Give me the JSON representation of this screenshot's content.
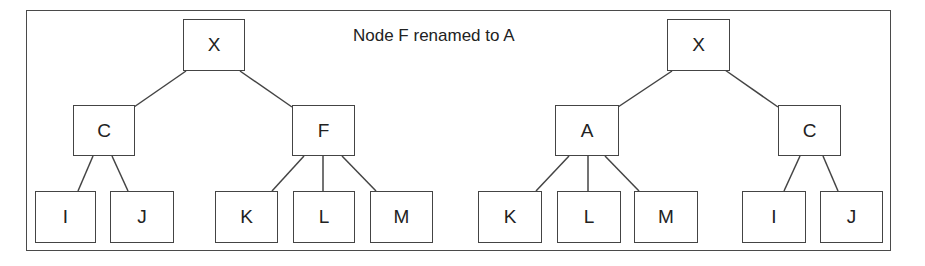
{
  "caption": "Node F renamed to A",
  "frame": {
    "x": 26,
    "y": 10,
    "w": 865,
    "h": 241
  },
  "colors": {
    "line": "#444444",
    "text": "#222222",
    "background": "#ffffff"
  },
  "trees": [
    {
      "name": "before",
      "nodes": [
        {
          "id": "X",
          "label": "X",
          "x": 183,
          "y": 19,
          "w": 62,
          "h": 52
        },
        {
          "id": "C",
          "label": "C",
          "x": 73,
          "y": 105,
          "w": 62,
          "h": 51
        },
        {
          "id": "F",
          "label": "F",
          "x": 292,
          "y": 105,
          "w": 63,
          "h": 51
        },
        {
          "id": "I",
          "label": "I",
          "x": 35,
          "y": 191,
          "w": 61,
          "h": 52
        },
        {
          "id": "J",
          "label": "J",
          "x": 110,
          "y": 191,
          "w": 64,
          "h": 52
        },
        {
          "id": "K",
          "label": "K",
          "x": 215,
          "y": 191,
          "w": 63,
          "h": 52
        },
        {
          "id": "L",
          "label": "L",
          "x": 293,
          "y": 191,
          "w": 62,
          "h": 52
        },
        {
          "id": "M",
          "label": "M",
          "x": 370,
          "y": 191,
          "w": 63,
          "h": 52
        }
      ],
      "edges": [
        {
          "from": "X",
          "to": "C",
          "x1": 186,
          "y1": 71,
          "x2": 134,
          "y2": 107
        },
        {
          "from": "X",
          "to": "F",
          "x1": 240,
          "y1": 71,
          "x2": 292,
          "y2": 107
        },
        {
          "from": "C",
          "to": "I",
          "x1": 93,
          "y1": 156,
          "x2": 78,
          "y2": 191
        },
        {
          "from": "C",
          "to": "J",
          "x1": 112,
          "y1": 156,
          "x2": 128,
          "y2": 191
        },
        {
          "from": "F",
          "to": "K",
          "x1": 304,
          "y1": 156,
          "x2": 272,
          "y2": 191
        },
        {
          "from": "F",
          "to": "L",
          "x1": 323,
          "y1": 156,
          "x2": 323,
          "y2": 191
        },
        {
          "from": "F",
          "to": "M",
          "x1": 342,
          "y1": 156,
          "x2": 376,
          "y2": 191
        }
      ]
    },
    {
      "name": "after",
      "nodes": [
        {
          "id": "X",
          "label": "X",
          "x": 667,
          "y": 19,
          "w": 63,
          "h": 52
        },
        {
          "id": "A",
          "label": "A",
          "x": 555,
          "y": 105,
          "w": 64,
          "h": 51
        },
        {
          "id": "C",
          "label": "C",
          "x": 778,
          "y": 105,
          "w": 63,
          "h": 51
        },
        {
          "id": "K",
          "label": "K",
          "x": 478,
          "y": 191,
          "w": 64,
          "h": 52
        },
        {
          "id": "L",
          "label": "L",
          "x": 557,
          "y": 191,
          "w": 64,
          "h": 52
        },
        {
          "id": "M",
          "label": "M",
          "x": 634,
          "y": 191,
          "w": 64,
          "h": 52
        },
        {
          "id": "I",
          "label": "I",
          "x": 742,
          "y": 191,
          "w": 64,
          "h": 52
        },
        {
          "id": "J",
          "label": "J",
          "x": 820,
          "y": 191,
          "w": 63,
          "h": 52
        }
      ],
      "edges": [
        {
          "from": "X",
          "to": "A",
          "x1": 672,
          "y1": 71,
          "x2": 618,
          "y2": 107
        },
        {
          "from": "X",
          "to": "C",
          "x1": 725,
          "y1": 70,
          "x2": 778,
          "y2": 107
        },
        {
          "from": "A",
          "to": "K",
          "x1": 569,
          "y1": 156,
          "x2": 536,
          "y2": 191
        },
        {
          "from": "A",
          "to": "L",
          "x1": 588,
          "y1": 156,
          "x2": 588,
          "y2": 191
        },
        {
          "from": "A",
          "to": "M",
          "x1": 605,
          "y1": 156,
          "x2": 639,
          "y2": 191
        },
        {
          "from": "C",
          "to": "I",
          "x1": 800,
          "y1": 156,
          "x2": 784,
          "y2": 191
        },
        {
          "from": "C",
          "to": "J",
          "x1": 823,
          "y1": 156,
          "x2": 838,
          "y2": 191
        }
      ]
    }
  ]
}
